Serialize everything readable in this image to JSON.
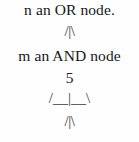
{
  "document": {
    "background_color": "#fefefe",
    "text_color": "#171717",
    "branch_color": "#3a3a3a",
    "lines": [
      {
        "id": "or-node-text",
        "kind": "prose",
        "text": "n an OR node."
      },
      {
        "id": "branch-top",
        "kind": "ascii-branch",
        "text": "/|\\"
      },
      {
        "id": "and-node-text",
        "kind": "prose",
        "text": "m an AND node"
      },
      {
        "id": "node-number",
        "kind": "numeral",
        "text": "5"
      },
      {
        "id": "branch-wide",
        "kind": "ascii-branch",
        "text": "/__|__\\"
      },
      {
        "id": "branch-bottom",
        "kind": "ascii-branch",
        "text": "/|\\"
      }
    ]
  }
}
